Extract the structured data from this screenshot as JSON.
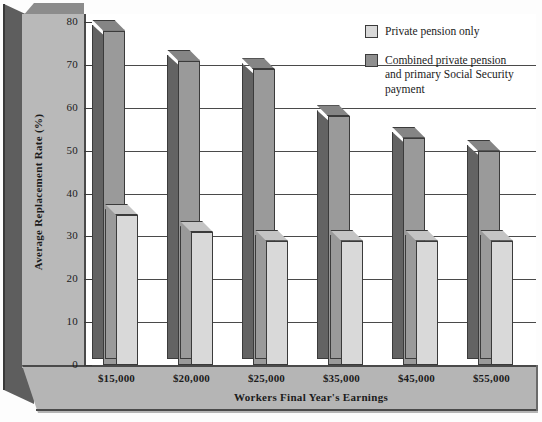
{
  "chart_data": {
    "type": "bar",
    "title": "",
    "xlabel": "Workers Final Year's Earnings",
    "ylabel": "Average Replacement Rate (%)",
    "ylim": [
      0,
      80
    ],
    "yticks": [
      0,
      10,
      20,
      30,
      40,
      50,
      60,
      70,
      80
    ],
    "grid": true,
    "legend_position": "top-right",
    "style": "3d-bar",
    "categories": [
      "$15,000",
      "$20,000",
      "$25,000",
      "$35,000",
      "$45,000",
      "$55,000"
    ],
    "series": [
      {
        "name": "Private pension only",
        "color": "#d9d9d9",
        "values": [
          35,
          31,
          29,
          29,
          29,
          29
        ]
      },
      {
        "name": "Combined private pension and primary Social Security payment",
        "color": "#8f8f8f",
        "values": [
          78,
          71,
          69,
          58,
          53,
          50
        ]
      }
    ]
  },
  "axes": {
    "y_title": "Average Replacement Rate (%)",
    "x_title": "Workers Final Year's Earnings",
    "y_tick_labels": [
      "80",
      "70",
      "60",
      "50",
      "40",
      "30",
      "20",
      "10",
      "0"
    ],
    "x_tick_labels": [
      "$15,000",
      "$20,000",
      "$25,000",
      "$35,000",
      "$45,000",
      "$55,000"
    ]
  },
  "legend": {
    "items": [
      {
        "label": "Private pension only",
        "swatch": "light-gray"
      },
      {
        "label": "Combined private pension and primary Social Security payment",
        "swatch": "dark-gray"
      }
    ],
    "item_0_line_0": "Private pension only",
    "item_1_line_0": "Combined private pension",
    "item_1_line_1": "and primary Social Security",
    "item_1_line_2": "payment"
  },
  "colors": {
    "series_light": "#d9d9d9",
    "series_dark": "#8f8f8f",
    "panel": "#b9b9b9",
    "wall": "#5e5e5e",
    "floor": "#b5b5b5",
    "ink": "#1b1b1b"
  }
}
